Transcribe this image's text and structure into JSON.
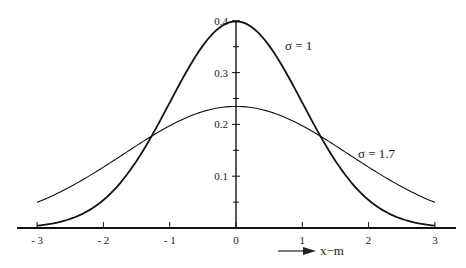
{
  "chart_data": {
    "type": "line",
    "title": "",
    "xlabel": "x−m",
    "ylabel": "",
    "xlim": [
      -3.3,
      3.3
    ],
    "ylim": [
      0,
      0.4
    ],
    "grid": false,
    "legend": "inline annotations",
    "x_ticks": [
      -3,
      -2,
      -1,
      0,
      1,
      2,
      3
    ],
    "x_tick_labels": [
      "- 3",
      "- 2",
      "- 1",
      "0",
      "1",
      "2",
      "3"
    ],
    "y_ticks": [
      0.1,
      0.2,
      0.3,
      0.4
    ],
    "y_tick_labels": [
      "0.1",
      "0.2",
      "0.3",
      "0.4"
    ],
    "y_minor_ticks": [
      0.05,
      0.15,
      0.25,
      0.35
    ],
    "series": [
      {
        "name": "σ = 1",
        "sigma": 1,
        "stroke_width": 1.8,
        "x": [
          -3,
          -2.5,
          -2,
          -1.5,
          -1,
          -0.5,
          0,
          0.5,
          1,
          1.5,
          2,
          2.5,
          3
        ],
        "values": [
          0.0044,
          0.0175,
          0.054,
          0.1295,
          0.242,
          0.3521,
          0.3989,
          0.3521,
          0.242,
          0.1295,
          0.054,
          0.0175,
          0.0044
        ]
      },
      {
        "name": "σ = 1.7",
        "sigma": 1.7,
        "stroke_width": 1.1,
        "x": [
          -3,
          -2.5,
          -2,
          -1.5,
          -1,
          -0.5,
          0,
          0.5,
          1,
          1.5,
          2,
          2.5,
          3
        ],
        "values": [
          0.0494,
          0.0797,
          0.1178,
          0.1591,
          0.1975,
          0.2248,
          0.2347,
          0.2248,
          0.1975,
          0.1591,
          0.1178,
          0.0797,
          0.0494
        ]
      }
    ],
    "annotations": [
      {
        "text": "σ = 1",
        "x": 0.75,
        "y": 0.34
      },
      {
        "text": "σ = 1.7",
        "x": 1.85,
        "y": 0.2
      },
      {
        "text": "→ x−m",
        "x": 1.6,
        "y": -0.05
      }
    ]
  },
  "labels": {
    "sigma1": "σ = 1",
    "sigma17": "σ = 1.7",
    "xaxis_title": "x−m"
  }
}
